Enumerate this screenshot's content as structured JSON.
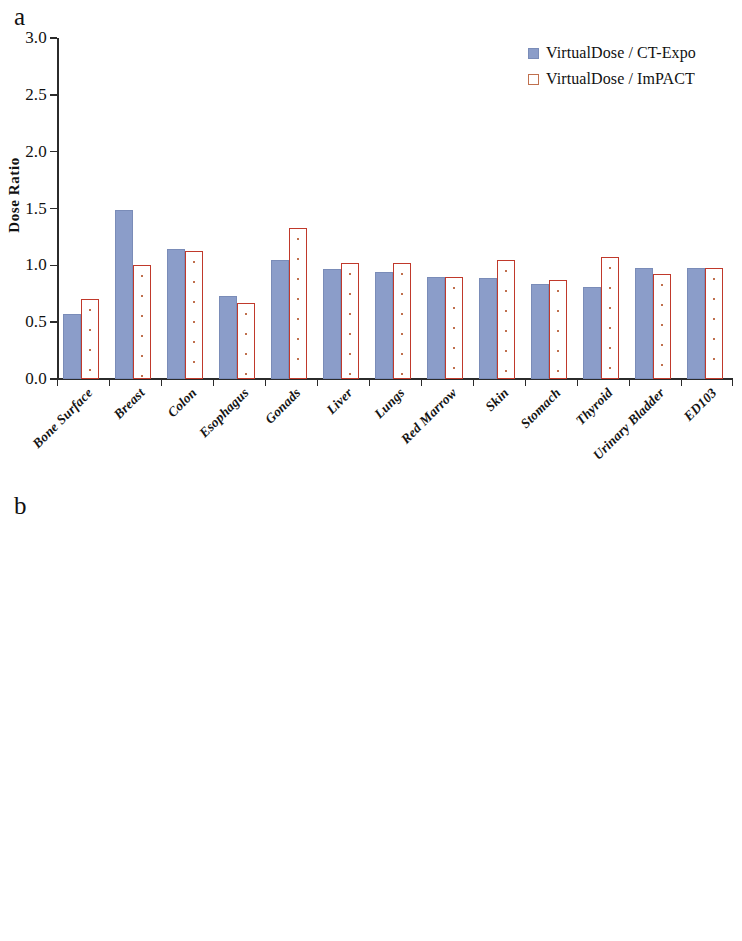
{
  "figure": {
    "panel_a_letter": "a",
    "panel_b_letter": "b"
  },
  "legend": {
    "series": [
      {
        "label": "VirtualDose / CT-Expo",
        "color": "#8b9dc9",
        "style": "filled"
      },
      {
        "label": "VirtualDose / ImPACT",
        "color": "#c0392b",
        "style": "outlined-dotted"
      }
    ]
  },
  "chart_data": [
    {
      "type": "bar",
      "panel": "a",
      "title": "",
      "xlabel": "",
      "ylabel": "Dose Ratio",
      "ylim": [
        0.0,
        3.0
      ],
      "yticks": [
        "0.0",
        "0.5",
        "1.0",
        "1.5",
        "2.0",
        "2.5",
        "3.0"
      ],
      "ytick_values": [
        0.0,
        0.5,
        1.0,
        1.5,
        2.0,
        2.5,
        3.0
      ],
      "grid": false,
      "legend_position": "top-right",
      "categories": [
        "Bone Surface",
        "Breast",
        "Colon",
        "Esophagus",
        "Gonads",
        "Liver",
        "Lungs",
        "Red Marrow",
        "Skin",
        "Stomach",
        "Thyroid",
        "Urinary Bladder",
        "ED103"
      ],
      "series": [
        {
          "name": "VirtualDose / CT-Expo",
          "color": "#8b9dc9",
          "values": [
            0.57,
            1.49,
            1.14,
            0.73,
            1.05,
            0.97,
            0.94,
            0.9,
            0.89,
            0.84,
            0.81,
            0.98,
            0.98
          ]
        },
        {
          "name": "VirtualDose / ImPACT",
          "color": "#c0392b",
          "values": [
            0.7,
            1.0,
            1.13,
            0.67,
            1.33,
            1.02,
            1.02,
            0.9,
            1.05,
            0.87,
            1.07,
            0.92,
            0.98
          ]
        }
      ]
    },
    {
      "type": "bar",
      "panel": "b",
      "title": "",
      "xlabel": "",
      "ylabel": "Dose Ratio",
      "ylim": [
        0.0,
        3.0
      ],
      "yticks": [
        "0.0",
        "0.5",
        "1.0",
        "1.5",
        "2.0",
        "2.5",
        "3.0"
      ],
      "ytick_values": [
        0.0,
        0.5,
        1.0,
        1.5,
        2.0,
        2.5,
        3.0
      ],
      "grid": false,
      "legend_position": "top-right",
      "categories": [
        "Adrenals",
        "ET Region",
        "Gall Bladder",
        "Heart",
        "Kidneys",
        "Lymph Nodes",
        "Muscle",
        "Pancreas",
        "Small Intestine",
        "Spleen",
        "Thymus",
        "Uterus(F)/Prostate(M)"
      ],
      "series": [
        {
          "name": "VirtualDose / CT-Expo",
          "color": "#8b9dc9",
          "values": [
            1.22,
            0.2,
            0.91,
            1.06,
            1.05,
            1.28,
            1.0,
            1.06,
            1.1,
            0.98,
            1.03,
            1.01
          ]
        },
        {
          "name": "VirtualDose / ImPACT",
          "color": "#c0392b",
          "values": [
            1.16,
            0.27,
            0.81,
            1.0,
            1.06,
            1.47,
            1.16,
            1.04,
            1.08,
            1.07,
            0.96,
            0.93
          ]
        }
      ]
    }
  ]
}
